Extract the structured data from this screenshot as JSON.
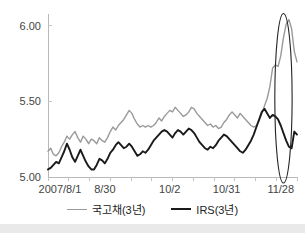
{
  "chart_data": {
    "type": "line",
    "title": "",
    "subtitle": "",
    "xlabel": "",
    "ylabel": "",
    "ylim": [
      5.0,
      6.05
    ],
    "yticks": [
      "5.00",
      "5.50",
      "6.00"
    ],
    "ytick_values": [
      5.0,
      5.5,
      6.0
    ],
    "grid": false,
    "legend_position": "bottom",
    "xtick_labels": [
      "2007/8/1",
      "8/30",
      "10/2",
      "10/31",
      "11/28"
    ],
    "xtick_indices": [
      0,
      21,
      45,
      66,
      86
    ],
    "x_count": 93,
    "series": [
      {
        "name": "국고채(3년)",
        "color": "#9a9a9a",
        "width": 1.4,
        "values": [
          5.17,
          5.19,
          5.15,
          5.14,
          5.16,
          5.2,
          5.23,
          5.27,
          5.25,
          5.28,
          5.3,
          5.26,
          5.23,
          5.27,
          5.25,
          5.22,
          5.25,
          5.24,
          5.22,
          5.26,
          5.24,
          5.23,
          5.26,
          5.3,
          5.33,
          5.31,
          5.34,
          5.36,
          5.38,
          5.41,
          5.44,
          5.42,
          5.38,
          5.35,
          5.33,
          5.34,
          5.33,
          5.34,
          5.33,
          5.34,
          5.36,
          5.39,
          5.37,
          5.4,
          5.42,
          5.44,
          5.43,
          5.46,
          5.44,
          5.42,
          5.4,
          5.41,
          5.43,
          5.46,
          5.45,
          5.42,
          5.4,
          5.38,
          5.36,
          5.34,
          5.35,
          5.33,
          5.34,
          5.32,
          5.33,
          5.36,
          5.38,
          5.41,
          5.43,
          5.41,
          5.39,
          5.42,
          5.4,
          5.38,
          5.36,
          5.34,
          5.33,
          5.34,
          5.37,
          5.42,
          5.47,
          5.52,
          5.6,
          5.72,
          5.74,
          5.73,
          5.8,
          5.92,
          6.01,
          6.04,
          5.98,
          5.83,
          5.76
        ]
      },
      {
        "name": "IRS(3년)",
        "color": "#1a1a1a",
        "width": 1.9,
        "values": [
          5.05,
          5.06,
          5.08,
          5.1,
          5.09,
          5.13,
          5.17,
          5.22,
          5.18,
          5.13,
          5.1,
          5.14,
          5.18,
          5.14,
          5.1,
          5.07,
          5.05,
          5.05,
          5.08,
          5.12,
          5.11,
          5.09,
          5.12,
          5.16,
          5.18,
          5.21,
          5.23,
          5.21,
          5.19,
          5.2,
          5.22,
          5.2,
          5.17,
          5.14,
          5.15,
          5.17,
          5.16,
          5.18,
          5.21,
          5.24,
          5.26,
          5.28,
          5.3,
          5.31,
          5.3,
          5.28,
          5.26,
          5.29,
          5.31,
          5.3,
          5.28,
          5.3,
          5.32,
          5.31,
          5.29,
          5.26,
          5.23,
          5.21,
          5.19,
          5.18,
          5.2,
          5.19,
          5.21,
          5.24,
          5.26,
          5.28,
          5.27,
          5.25,
          5.23,
          5.21,
          5.19,
          5.17,
          5.16,
          5.18,
          5.21,
          5.24,
          5.28,
          5.33,
          5.38,
          5.43,
          5.45,
          5.42,
          5.39,
          5.41,
          5.4,
          5.38,
          5.34,
          5.29,
          5.24,
          5.2,
          5.19,
          5.3,
          5.28
        ]
      }
    ],
    "annotations": [
      {
        "kind": "ellipse",
        "name": "spike-highlight-ellipse",
        "cx_index": 87,
        "cy_value": 5.52,
        "rx_index": 3.2,
        "ry_value": 0.56,
        "color": "#222222"
      }
    ]
  },
  "legend": {
    "items": [
      {
        "label": "국고채(3년)",
        "color": "#9a9a9a",
        "width": 1.6
      },
      {
        "label": "IRS(3년)",
        "color": "#1a1a1a",
        "width": 2.4
      }
    ]
  },
  "axis": {
    "line_color": "#b8b8b8",
    "tick_color": "#c4c4c4",
    "label_color": "#444444"
  }
}
